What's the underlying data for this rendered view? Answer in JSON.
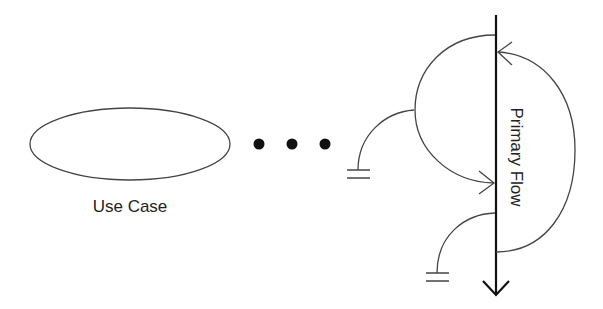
{
  "diagram": {
    "use_case": {
      "label": "Use Case"
    },
    "ellipsis": {
      "dot_count": 3
    },
    "primary_flow": {
      "label": "Primary Flow"
    },
    "colors": {
      "stroke": "#333333",
      "main_line": "#111111",
      "text": "#222222",
      "background": "#ffffff"
    },
    "elements": [
      "use-case-ellipse",
      "ellipsis-dots",
      "primary-flow-line-with-arrow",
      "alternate-flow-left-loop",
      "alternate-flow-right-loop",
      "exception-branch-upper-with-ground",
      "exception-branch-lower-with-ground"
    ]
  }
}
